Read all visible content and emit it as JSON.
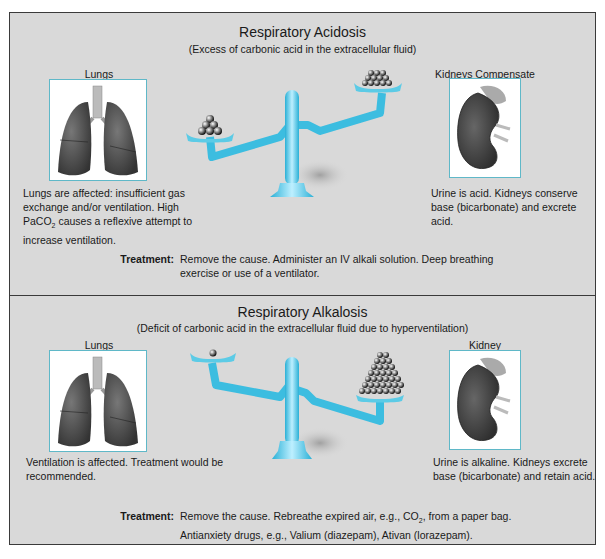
{
  "colors": {
    "background_panel": "#d9d9d9",
    "border": "#3a3a3a",
    "image_box_border": "#5fb8c8",
    "scale_blue": "#4cc3e0",
    "organ_gray": "#4a4a4a"
  },
  "acidosis": {
    "title": "Respiratory Acidosis",
    "subtitle": "(Excess of carbonic acid in the extracellular fluid)",
    "left_label": "Lungs",
    "right_label": "Kidneys Compensate",
    "left_icon": "lungs-icon",
    "right_icon": "kidney-icon",
    "scale_icon": "balance-scale-icon",
    "scale_state": "left pan low with 6 balls (base), right pan high with 10 balls (acid)",
    "left_desc_lines": [
      "Lungs are affected: insufficient gas",
      "exchange and/or ventilation. High",
      "PaCO",
      "2",
      " causes a reflexive attempt to",
      "increase ventilation."
    ],
    "right_desc_lines": [
      "Urine is acid. Kidneys conserve",
      "base (bicarbonate) and excrete",
      "acid."
    ],
    "treatment_label": "Treatment:",
    "treatment_lines": [
      "Remove the cause. Administer an IV alkali solution. Deep breathing",
      "exercise or use of a ventilator."
    ]
  },
  "alkalosis": {
    "title": "Respiratory Alkalosis",
    "subtitle": "(Deficit of carbonic acid in the extracellular fluid due to hyperventilation)",
    "left_label": "Lungs",
    "right_label": "Kidney",
    "left_icon": "lungs-icon",
    "right_icon": "kidney-icon",
    "scale_icon": "balance-scale-icon",
    "scale_state": "left pan high with 1 ball, right pan low with many balls",
    "left_desc_lines": [
      "Ventilation is affected. Treatment would be",
      "recommended."
    ],
    "right_desc_lines": [
      "Urine is alkaline. Kidneys excrete",
      "base (bicarbonate) and retain acid."
    ],
    "treatment_label": "Treatment:",
    "treatment_lines": [
      "Remove the cause. Rebreathe expired air, e.g., CO",
      "2",
      ", from a paper bag.",
      "Antianxiety drugs, e.g., Valium (diazepam), Ativan (lorazepam)."
    ]
  }
}
